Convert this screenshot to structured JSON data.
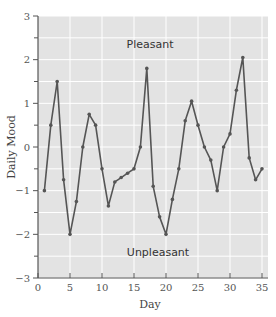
{
  "chart_data": {
    "type": "line",
    "title": "",
    "xlabel": "Day",
    "ylabel": "Daily Mood",
    "xlim": [
      0,
      35
    ],
    "ylim": [
      -3,
      3
    ],
    "x_ticks": [
      0,
      5,
      10,
      15,
      20,
      25,
      30,
      35
    ],
    "y_ticks": [
      -3,
      -2,
      -1,
      0,
      1,
      2,
      3
    ],
    "grid": true,
    "legend": null,
    "annotations": [
      {
        "text": "Pleasant",
        "x": 17.5,
        "y": 2.35
      },
      {
        "text": "Unpleasant",
        "x": 17.5,
        "y": -2.4
      }
    ],
    "series": [
      {
        "name": "Daily Mood",
        "color": "#555555",
        "x": [
          1,
          2,
          3,
          4,
          5,
          6,
          7,
          8,
          9,
          10,
          11,
          12,
          13,
          14,
          15,
          16,
          17,
          18,
          19,
          20,
          21,
          22,
          23,
          24,
          25,
          26,
          27,
          28,
          29,
          30,
          31,
          32,
          33,
          34,
          35
        ],
        "values": [
          -1,
          0.5,
          1.5,
          -0.75,
          -2,
          -1.25,
          0,
          0.75,
          0.5,
          -0.5,
          -1.35,
          -0.8,
          -0.7,
          -0.6,
          -0.5,
          0,
          1.8,
          -0.9,
          -1.6,
          -2,
          -1.2,
          -0.5,
          0.6,
          1.05,
          0.5,
          0,
          -0.3,
          -1,
          0,
          0.3,
          1.3,
          2.05,
          -0.25,
          -0.75,
          -0.5
        ]
      }
    ]
  },
  "colors": {
    "plot_bg": "#e3e3e3",
    "grid": "#ffffff",
    "line": "#555555",
    "axis": "#555555"
  }
}
